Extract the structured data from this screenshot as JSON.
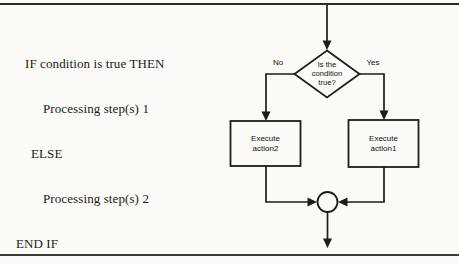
{
  "pseudocode": {
    "lines": [
      "IF condition is true THEN",
      "Processing step(s) 1",
      "ELSE",
      "Processing step(s) 2",
      "END IF"
    ]
  },
  "flowchart": {
    "decision": {
      "line1": "Is the",
      "line2": "condition",
      "line3": "true?"
    },
    "branch_labels": {
      "no": "No",
      "yes": "Yes"
    },
    "left_box": {
      "line1": "Execute",
      "line2": "action2"
    },
    "right_box": {
      "line1": "Execute",
      "line2": "action1"
    }
  },
  "colors": {
    "ink": "#1f1c19",
    "paper": "#fbfaf6"
  }
}
